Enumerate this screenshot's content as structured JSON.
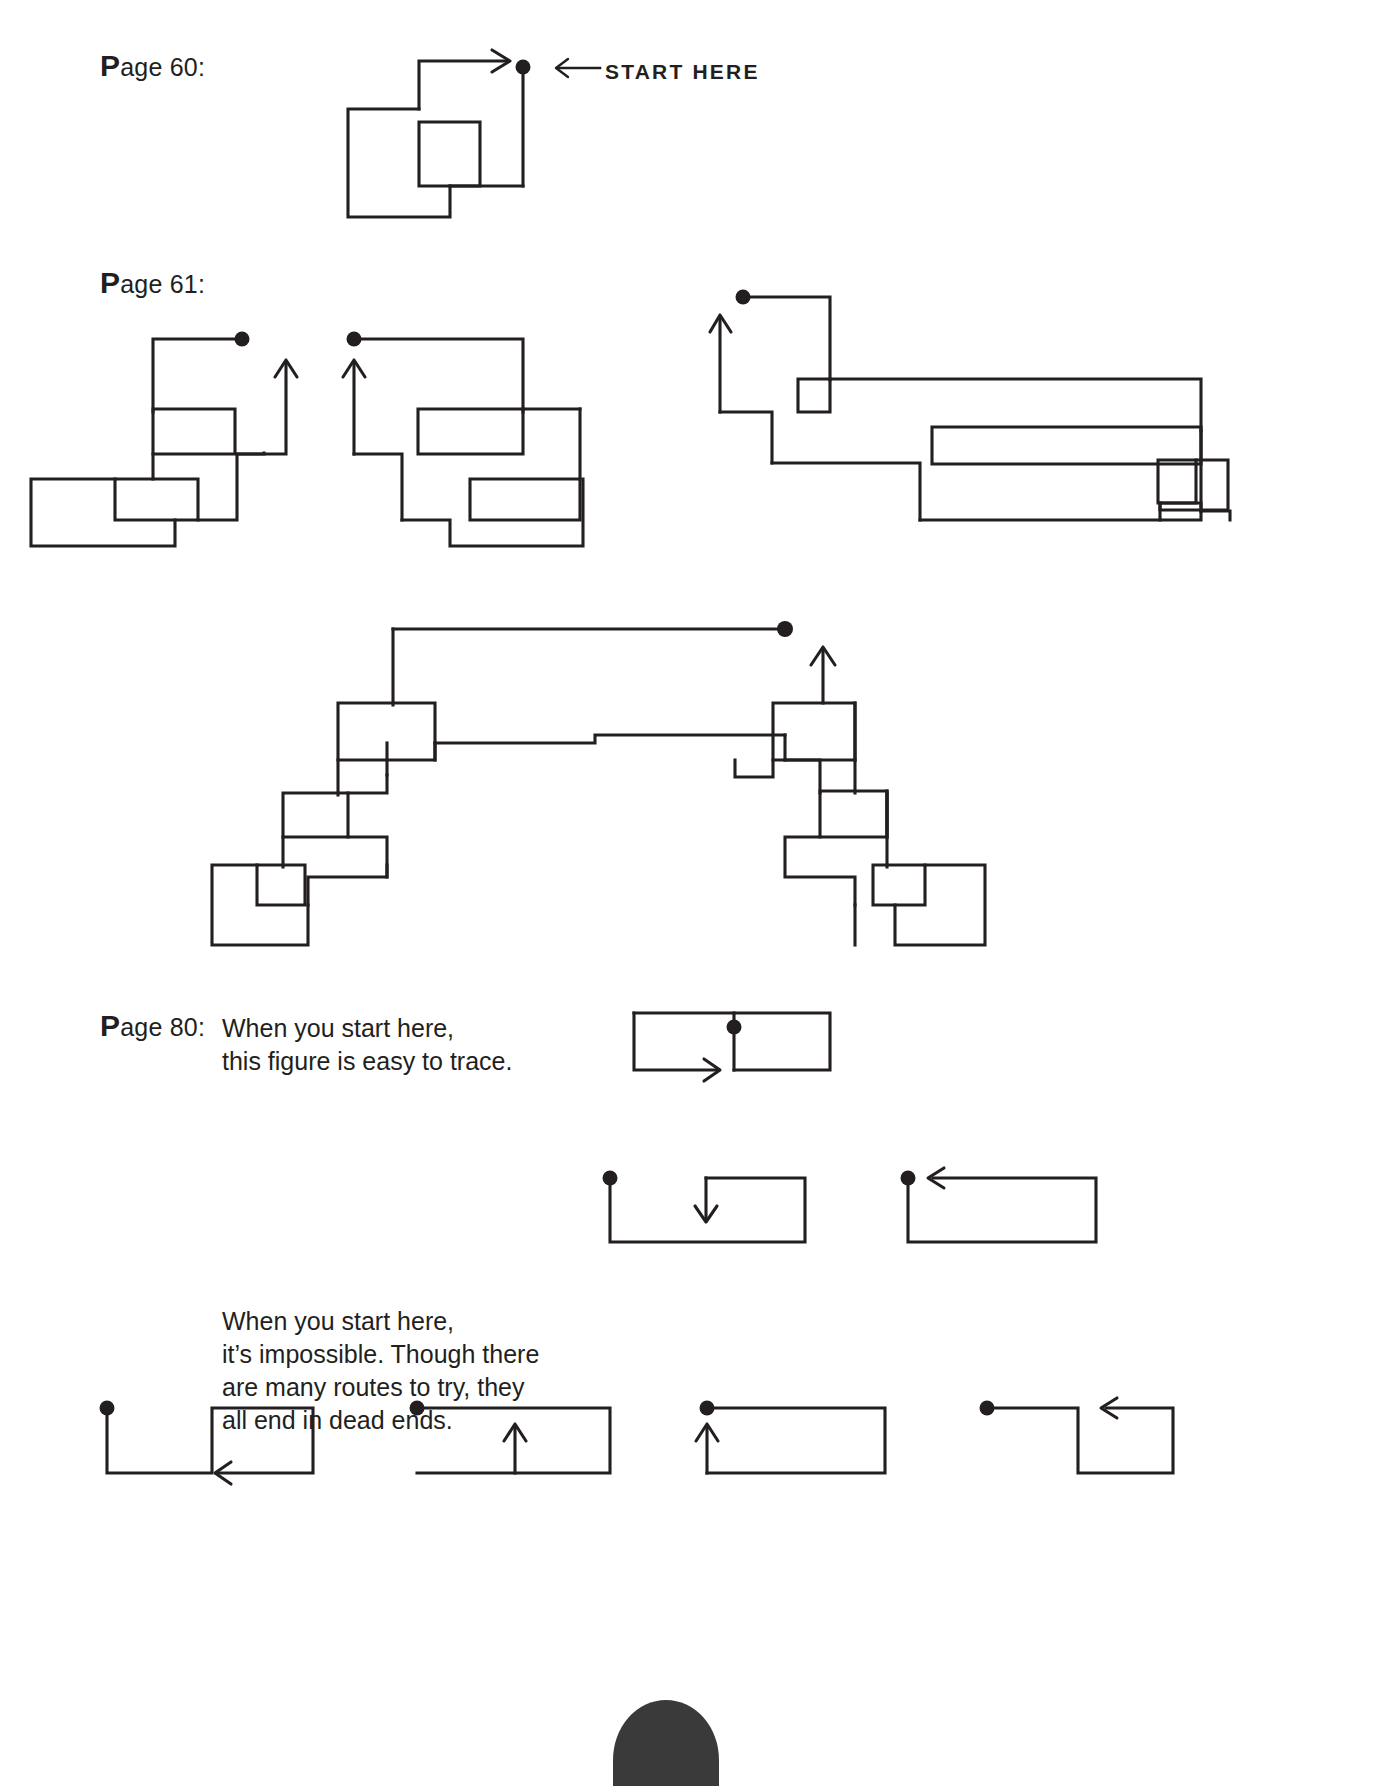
{
  "document": {
    "type": "puzzle-solutions-page",
    "ink_color": "#231f20",
    "background": "#ffffff"
  },
  "sections": [
    {
      "id": "page-60",
      "label": "Page 60:",
      "label_first_letter": "P",
      "label_rest": "age 60:",
      "annotation": "START HERE",
      "annotation_arrow": "left-arrow",
      "figures": 1
    },
    {
      "id": "page-61",
      "label": "Page 61:",
      "label_first_letter": "P",
      "label_rest": "age 61:",
      "figures": 4
    },
    {
      "id": "page-80",
      "label": "Page 80:",
      "label_first_letter": "P",
      "label_rest": "age 80:",
      "caption_1": "When you start here,\nthis figure is easy to trace.",
      "caption_1_lines": [
        "When you start here,",
        "this figure is easy to trace."
      ],
      "caption_2_lines": [
        "When you start here,",
        "it’s impossible. Though there",
        "are many routes to try, they",
        "all end in dead ends."
      ],
      "figures": 6
    }
  ],
  "legend": {
    "dot_meaning": "start point",
    "arrow_meaning": "direction of travel"
  }
}
